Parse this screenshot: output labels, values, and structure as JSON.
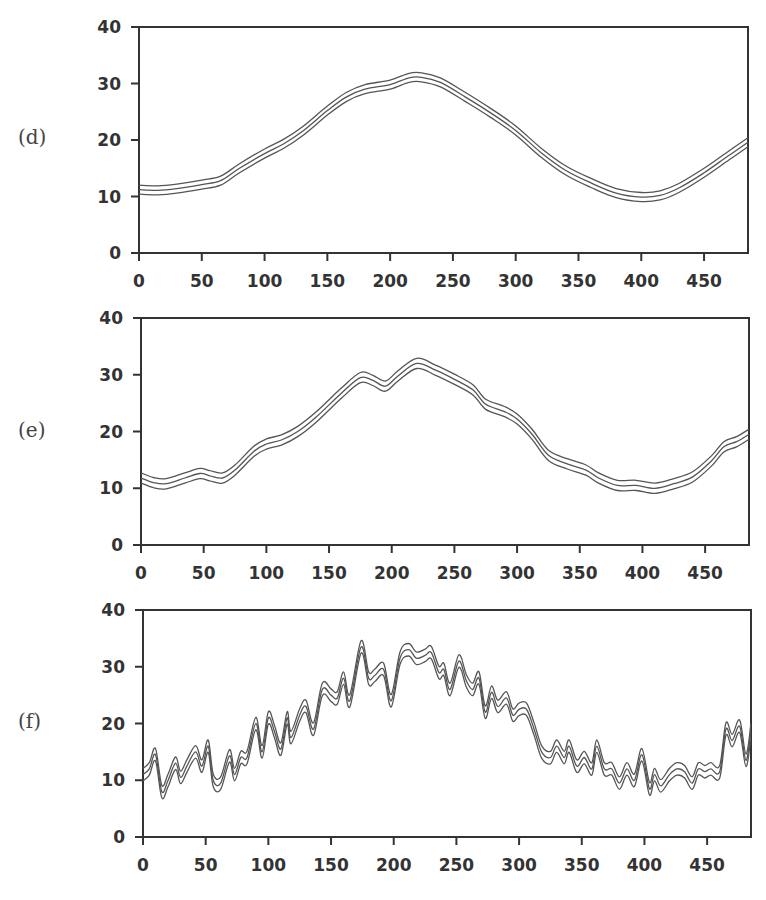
{
  "figure": {
    "panels": [
      {
        "id": "d",
        "label": "(d)"
      },
      {
        "id": "e",
        "label": "(e)"
      },
      {
        "id": "f",
        "label": "(f)"
      }
    ]
  },
  "chart_data": [
    {
      "type": "line",
      "title": "(d)",
      "xlabel": "",
      "ylabel": "",
      "xlim": [
        0,
        485
      ],
      "ylim": [
        0,
        40
      ],
      "xticks": [
        0,
        50,
        100,
        150,
        200,
        250,
        300,
        350,
        400,
        450
      ],
      "yticks": [
        0,
        10,
        20,
        30,
        40
      ],
      "grid": false,
      "band_offset": 0.8,
      "series": [
        {
          "name": "center",
          "x": [
            0,
            15,
            30,
            50,
            65,
            80,
            100,
            115,
            130,
            150,
            165,
            180,
            200,
            215,
            225,
            240,
            260,
            280,
            300,
            320,
            340,
            360,
            380,
            400,
            415,
            430,
            450,
            470,
            485
          ],
          "y": [
            11.2,
            11.1,
            11.4,
            12.1,
            12.8,
            15,
            17.6,
            19.3,
            21.5,
            25.2,
            27.6,
            29,
            29.8,
            31,
            31.1,
            30.2,
            27.6,
            24.8,
            21.7,
            17.8,
            14.6,
            12.4,
            10.6,
            9.9,
            10.2,
            11.5,
            14.2,
            17.3,
            19.6
          ]
        }
      ]
    },
    {
      "type": "line",
      "title": "(e)",
      "xlabel": "",
      "ylabel": "",
      "xlim": [
        0,
        485
      ],
      "ylim": [
        0,
        40
      ],
      "xticks": [
        0,
        50,
        100,
        150,
        200,
        250,
        300,
        350,
        400,
        450
      ],
      "yticks": [
        0,
        10,
        20,
        30,
        40
      ],
      "grid": false,
      "band_offset": 0.9,
      "series": [
        {
          "name": "center",
          "x": [
            0,
            10,
            20,
            35,
            47,
            55,
            65,
            75,
            90,
            100,
            112,
            125,
            140,
            160,
            175,
            185,
            195,
            205,
            220,
            235,
            250,
            265,
            275,
            290,
            300,
            312,
            325,
            340,
            355,
            365,
            380,
            395,
            410,
            425,
            440,
            455,
            465,
            475,
            485
          ],
          "y": [
            11.8,
            11,
            10.8,
            11.8,
            12.6,
            12.2,
            11.8,
            13.2,
            16.5,
            17.8,
            18.5,
            20,
            22.6,
            26.8,
            29.5,
            29,
            28,
            29.8,
            32,
            30.8,
            29.2,
            27.3,
            24.8,
            23.5,
            22.2,
            19.5,
            15.8,
            14.3,
            13.2,
            11.8,
            10.5,
            10.5,
            10,
            10.8,
            12,
            14.8,
            17.3,
            18.2,
            19.5
          ]
        }
      ]
    },
    {
      "type": "line",
      "title": "(f)",
      "xlabel": "",
      "ylabel": "",
      "xlim": [
        0,
        485
      ],
      "ylim": [
        0,
        40
      ],
      "xticks": [
        0,
        50,
        100,
        150,
        200,
        250,
        300,
        350,
        400,
        450
      ],
      "yticks": [
        0,
        10,
        20,
        30,
        40
      ],
      "grid": false,
      "band_offset": 1.1,
      "series": [
        {
          "name": "center",
          "x": [
            0,
            5,
            10,
            15,
            20,
            26,
            30,
            35,
            42,
            47,
            52,
            56,
            62,
            69,
            73,
            78,
            83,
            90,
            95,
            100,
            105,
            110,
            115,
            118,
            125,
            130,
            136,
            143,
            150,
            155,
            160,
            165,
            174,
            180,
            185,
            192,
            198,
            205,
            212,
            218,
            225,
            230,
            236,
            240,
            245,
            252,
            258,
            263,
            268,
            273,
            278,
            283,
            290,
            295,
            300,
            306,
            312,
            318,
            325,
            330,
            336,
            340,
            346,
            352,
            358,
            362,
            368,
            374,
            380,
            386,
            392,
            398,
            404,
            408,
            413,
            420,
            426,
            432,
            438,
            443,
            448,
            453,
            460,
            465,
            470,
            476,
            481,
            485
          ],
          "y": [
            11,
            12,
            14.5,
            8,
            10,
            13,
            10.5,
            12.5,
            15,
            12.5,
            16,
            10,
            9.5,
            14.3,
            11,
            14,
            14,
            20,
            15,
            21,
            18.5,
            15.5,
            21,
            17.5,
            21.5,
            23,
            19,
            26,
            25,
            24.5,
            28,
            24,
            33.5,
            28,
            28.5,
            29.5,
            24,
            31.5,
            33,
            31.5,
            32,
            32.5,
            29,
            29.5,
            26,
            31,
            27.5,
            26,
            28,
            22,
            25.5,
            23,
            24.5,
            21.5,
            22.5,
            22.5,
            19,
            15,
            14,
            16,
            14,
            16,
            12.5,
            14,
            12,
            16,
            12,
            12,
            9.5,
            12,
            10,
            14.5,
            8.5,
            11,
            9,
            11,
            12,
            11.5,
            9.5,
            12,
            11.5,
            12,
            11.5,
            19,
            17,
            19.5,
            13.5,
            19,
            18,
            20
          ]
        }
      ]
    }
  ]
}
